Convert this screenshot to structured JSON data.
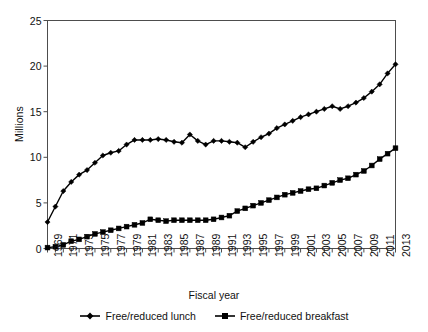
{
  "chart_data": {
    "type": "line",
    "title": "",
    "xlabel": "Fiscal year",
    "ylabel": "Millions",
    "ylim": [
      0,
      25
    ],
    "yticks": [
      0,
      5,
      10,
      15,
      20,
      25
    ],
    "xlim": [
      1969,
      2013
    ],
    "xtick_step": 2,
    "grid": false,
    "legend_position": "bottom",
    "x": [
      1969,
      1970,
      1971,
      1972,
      1973,
      1974,
      1975,
      1976,
      1977,
      1978,
      1979,
      1980,
      1981,
      1982,
      1983,
      1984,
      1985,
      1986,
      1987,
      1988,
      1989,
      1990,
      1991,
      1992,
      1993,
      1994,
      1995,
      1996,
      1997,
      1998,
      1999,
      2000,
      2001,
      2002,
      2003,
      2004,
      2005,
      2006,
      2007,
      2008,
      2009,
      2010,
      2011,
      2012,
      2013
    ],
    "xticklabels": [
      "1969",
      "1971",
      "1973",
      "1975",
      "1977",
      "1979",
      "1981",
      "1983",
      "1985",
      "1987",
      "1989",
      "1991",
      "1993",
      "1995",
      "1997",
      "1999",
      "2001",
      "2003",
      "2005",
      "2007",
      "2009",
      "2011",
      "2013"
    ],
    "series": [
      {
        "name": "Free/reduced lunch",
        "marker": "diamond",
        "color": "#000000",
        "values": [
          2.9,
          4.6,
          6.3,
          7.3,
          8.1,
          8.6,
          9.4,
          10.2,
          10.5,
          10.7,
          11.4,
          11.9,
          11.9,
          11.9,
          12.0,
          11.9,
          11.7,
          11.6,
          12.5,
          11.8,
          11.4,
          11.8,
          11.8,
          11.7,
          11.6,
          11.1,
          11.7,
          12.2,
          12.6,
          13.2,
          13.6,
          14.0,
          14.4,
          14.7,
          15.0,
          15.3,
          15.6,
          15.3,
          15.6,
          16.0,
          16.5,
          17.2,
          18.0,
          19.2,
          20.2
        ],
        "values_tail": [
          21.0,
          21.5,
          21.6
        ]
      },
      {
        "name": "Free/reduced breakfast",
        "marker": "square",
        "color": "#000000",
        "values": [
          0.1,
          0.2,
          0.4,
          0.8,
          1.0,
          1.3,
          1.6,
          1.8,
          2.0,
          2.2,
          2.4,
          2.6,
          2.8,
          3.2,
          3.1,
          3.0,
          3.1,
          3.1,
          3.1,
          3.1,
          3.1,
          3.2,
          3.4,
          3.6,
          4.1,
          4.4,
          4.7,
          5.0,
          5.3,
          5.6,
          5.9,
          6.1,
          6.3,
          6.5,
          6.6,
          6.9,
          7.2,
          7.5,
          7.7,
          8.1,
          8.5,
          9.1,
          9.8,
          10.4,
          11.0
        ]
      }
    ]
  },
  "axis": {
    "y_title": "Millions",
    "x_title": "Fiscal year"
  },
  "legend": {
    "entries": [
      {
        "label": "Free/reduced lunch",
        "marker": "diamond"
      },
      {
        "label": "Free/reduced breakfast",
        "marker": "square"
      }
    ]
  }
}
